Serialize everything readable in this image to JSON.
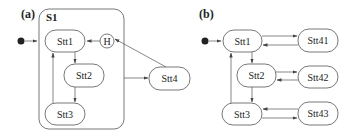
{
  "panels": [
    {
      "label": "(a)",
      "container": {
        "label": "S1"
      },
      "states": {
        "stt1": "Stt1",
        "stt2": "Stt2",
        "stt3": "Stt3",
        "stt4": "Stt4"
      },
      "history": {
        "label": "H"
      },
      "transitions": [
        [
          "initial",
          "Stt1"
        ],
        [
          "H",
          "Stt1"
        ],
        [
          "Stt1",
          "Stt2"
        ],
        [
          "Stt2",
          "Stt3"
        ],
        [
          "Stt3",
          "Stt1"
        ],
        [
          "S1",
          "Stt4"
        ],
        [
          "Stt4",
          "H"
        ]
      ]
    },
    {
      "label": "(b)",
      "states": {
        "stt1": "Stt1",
        "stt2": "Stt2",
        "stt3": "Stt3",
        "stt41": "Stt41",
        "stt42": "Stt42",
        "stt43": "Stt43"
      },
      "transitions": [
        [
          "initial",
          "Stt1"
        ],
        [
          "Stt1",
          "Stt2"
        ],
        [
          "Stt2",
          "Stt3"
        ],
        [
          "Stt3",
          "Stt1"
        ],
        [
          "Stt1",
          "Stt41"
        ],
        [
          "Stt41",
          "Stt1"
        ],
        [
          "Stt2",
          "Stt42"
        ],
        [
          "Stt42",
          "Stt2"
        ],
        [
          "Stt3",
          "Stt43"
        ],
        [
          "Stt43",
          "Stt3"
        ]
      ]
    }
  ],
  "colors": {
    "stroke": "#555555",
    "initial_dot": "#222222",
    "background": "#ffffff"
  }
}
